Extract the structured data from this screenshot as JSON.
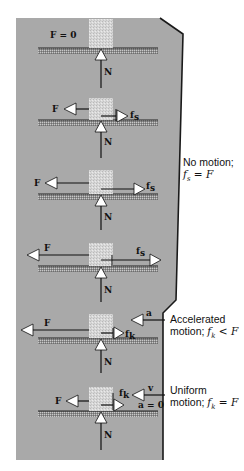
{
  "figure": {
    "colors": {
      "panel": "#a9a9a9",
      "panel_edge": "#1a1a1a",
      "block": "#d4d4d4",
      "ground": "#7a7a7a",
      "arrow_fill": "#ffffff",
      "line": "#111111"
    }
  },
  "cases": [
    {
      "id": 1,
      "applied_label": "F = 0",
      "friction_label": "",
      "friction_sub": "",
      "normal_label": "N",
      "extra": ""
    },
    {
      "id": 2,
      "applied_label": "F",
      "friction_label": "f",
      "friction_sub": "s",
      "normal_label": "N",
      "extra": ""
    },
    {
      "id": 3,
      "applied_label": "F",
      "friction_label": "f",
      "friction_sub": "s",
      "normal_label": "N",
      "extra": ""
    },
    {
      "id": 4,
      "applied_label": "F",
      "friction_label": "f",
      "friction_sub": "s",
      "normal_label": "N",
      "extra": ""
    },
    {
      "id": 5,
      "applied_label": "F",
      "friction_label": "f",
      "friction_sub": "k",
      "normal_label": "N",
      "extra": "a"
    },
    {
      "id": 6,
      "applied_label": "F",
      "friction_label": "f",
      "friction_sub": "k",
      "normal_label": "N",
      "extra": "v",
      "extra2": "a = 0"
    }
  ],
  "annotations": {
    "no_motion": {
      "line1": "No motion;",
      "line2_var": "f",
      "line2_sub": "s",
      "line2_rest": " = F"
    },
    "accelerated": {
      "line1": "Accelerated",
      "line2_text": "motion; ",
      "line2_var": "f",
      "line2_sub": "k",
      "line2_rest": " < F"
    },
    "uniform": {
      "line1": "Uniform",
      "line2_text": "motion; ",
      "line2_var": "f",
      "line2_sub": "k",
      "line2_rest": " = F"
    }
  }
}
